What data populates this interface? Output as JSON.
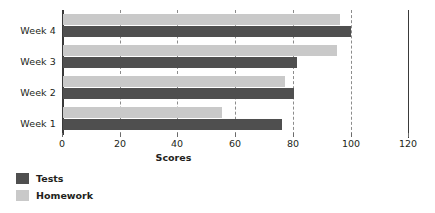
{
  "chart_data": {
    "type": "bar",
    "orientation": "horizontal",
    "title": "",
    "xlabel": "Scores",
    "ylabel": "",
    "categories": [
      "Week 1",
      "Week 2",
      "Week 3",
      "Week 4"
    ],
    "series": [
      {
        "name": "Tests",
        "color": "#4f4f4f",
        "values": [
          76,
          80,
          81,
          100
        ]
      },
      {
        "name": "Homework",
        "color": "#c9c9c9",
        "values": [
          55,
          77,
          95,
          96
        ]
      }
    ],
    "xlim": [
      0,
      120
    ],
    "xticks": [
      0,
      20,
      40,
      60,
      80,
      100,
      120
    ],
    "xtick_labels": [
      "0",
      "20",
      "40",
      "60",
      "80",
      "100",
      "120"
    ],
    "grid": true,
    "gridlines_dashed_at": [
      20,
      40,
      60,
      80,
      100
    ],
    "legend_position": "bottom-left"
  },
  "axis": {
    "x_title": "Scores"
  },
  "legend": {
    "items": [
      {
        "label": "Tests"
      },
      {
        "label": "Homework"
      }
    ]
  },
  "categories": {
    "week4": "Week 4",
    "week3": "Week 3",
    "week2": "Week 2",
    "week1": "Week 1"
  },
  "ticks": {
    "t0": "0",
    "t20": "20",
    "t40": "40",
    "t60": "60",
    "t80": "80",
    "t100": "100",
    "t120": "120"
  }
}
